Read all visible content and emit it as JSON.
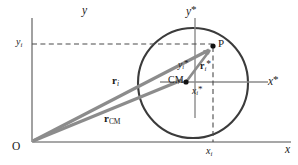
{
  "figure": {
    "kind": "physics-vector-diagram",
    "width": 298,
    "height": 165,
    "background_color": "#ffffff"
  },
  "colors": {
    "axis": "#8a8a8a",
    "vector": "#8c8c8c",
    "body_outline": "#3b3b3b",
    "dashed": "#4a4a4a",
    "text": "#1a1a1a",
    "point_fill": "#111111"
  },
  "axes": {
    "lab_frame": {
      "x_axis_label": "x",
      "y_axis_label": "y",
      "origin_label": "O"
    },
    "cm_frame": {
      "x_axis_label_base": "x",
      "x_axis_label_star": "*",
      "y_axis_label_base": "y",
      "y_axis_label_star": "*"
    }
  },
  "points": [
    {
      "id": "origin",
      "label": "O",
      "name": "origin-point"
    },
    {
      "id": "cm",
      "label": "CM",
      "name": "center-of-mass-point"
    },
    {
      "id": "p",
      "label": "P",
      "name": "particle-point-p"
    }
  ],
  "vectors": [
    {
      "id": "r_i",
      "symbol": "r",
      "subscript": "i",
      "star": "",
      "from": "O",
      "to": "P",
      "name": "vector-r-i"
    },
    {
      "id": "r_cm",
      "symbol": "r",
      "subscript": "CM",
      "star": "",
      "from": "O",
      "to": "CM",
      "name": "vector-r-cm"
    },
    {
      "id": "r_i_star",
      "symbol": "r",
      "subscript": "i",
      "star": "*",
      "from": "CM",
      "to": "P",
      "name": "vector-r-i-star"
    }
  ],
  "coordinate_labels": [
    {
      "id": "y_i",
      "base": "y",
      "subscript": "i",
      "star": "",
      "name": "coord-label-y-i"
    },
    {
      "id": "x_i",
      "base": "x",
      "subscript": "i",
      "star": "",
      "name": "coord-label-x-i"
    },
    {
      "id": "y_i_star",
      "base": "y",
      "subscript": "i",
      "star": "*",
      "name": "coord-label-y-i-star"
    },
    {
      "id": "x_i_star",
      "base": "x",
      "subscript": "i",
      "star": "*",
      "name": "coord-label-x-i-star"
    }
  ],
  "geometry": {
    "origin_px": [
      32,
      142
    ],
    "cm_px": [
      186,
      82
    ],
    "p_px": [
      213,
      46
    ],
    "circle_center_px": [
      193,
      83
    ],
    "circle_radius_px": 55,
    "x_axis_y_px": 142,
    "y_axis_x_px": 32,
    "star_x_axis_y_px": 82,
    "star_y_axis_x_px": 195
  }
}
